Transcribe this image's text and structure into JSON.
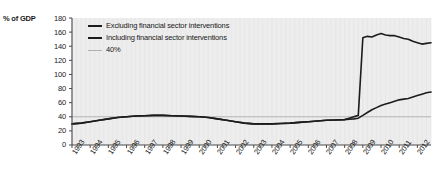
{
  "axis": {
    "y_unit_label": "% of GDP",
    "y_ticks": [
      "180",
      "160",
      "140",
      "120",
      "100",
      "80",
      "60",
      "40",
      "20",
      "0"
    ],
    "x_ticks": [
      "1993",
      "1994",
      "1995",
      "1996",
      "1997",
      "1998",
      "1999",
      "2000",
      "2001",
      "2002",
      "2003",
      "2004",
      "2005",
      "2006",
      "2007",
      "2008",
      "2009",
      "2010",
      "2011",
      "2012"
    ]
  },
  "legend": {
    "items": [
      {
        "label": "Excluding financial sector interventions",
        "style": "thick",
        "color": "#1c1c1c"
      },
      {
        "label": "Including financial sector interventions",
        "style": "thick",
        "color": "#1c1c1c"
      },
      {
        "label": "40%",
        "style": "thin",
        "color": "#b0b0b0"
      }
    ]
  },
  "colors": {
    "plot_background": "#ededed",
    "gridline": "#e2e2e2",
    "axis": "#4a4a4a",
    "series_line": "#1c1c1c",
    "reference_line": "#b5b5b5",
    "text": "#1a1a1a"
  },
  "chart_data": {
    "type": "line",
    "title": "",
    "xlabel": "",
    "ylabel": "% of GDP",
    "ylim": [
      0,
      180
    ],
    "xlim": [
      1993,
      2012.75
    ],
    "grid": true,
    "legend_position": "top-left-inside",
    "annotations": [
      {
        "type": "hline",
        "value": 40,
        "label": "40%"
      }
    ],
    "x": [
      1993,
      1993.5,
      1994,
      1994.5,
      1995,
      1995.5,
      1996,
      1996.5,
      1997,
      1997.5,
      1998,
      1998.5,
      1999,
      1999.5,
      2000,
      2000.5,
      2001,
      2001.5,
      2002,
      2002.5,
      2003,
      2003.5,
      2004,
      2004.5,
      2005,
      2005.5,
      2006,
      2006.5,
      2007,
      2007.5,
      2008,
      2008.25,
      2008.5,
      2008.75,
      2009,
      2009.25,
      2009.5,
      2009.75,
      2010,
      2010.25,
      2010.5,
      2010.75,
      2011,
      2011.25,
      2011.5,
      2011.75,
      2012,
      2012.25,
      2012.5,
      2012.75
    ],
    "series": [
      {
        "name": "Excluding financial sector interventions",
        "values": [
          30,
          31,
          33,
          35,
          37,
          39,
          40,
          41,
          41.5,
          42,
          42,
          41.5,
          41,
          40.5,
          40,
          39,
          37,
          35,
          33,
          31,
          30,
          30,
          30,
          30.5,
          31,
          32,
          33,
          34,
          35,
          35.5,
          36,
          36.5,
          37,
          38,
          42,
          46,
          50,
          53,
          56,
          58,
          60,
          62,
          64,
          65,
          66,
          68,
          70,
          72,
          74,
          75
        ]
      },
      {
        "name": "Including financial sector interventions",
        "values": [
          30,
          31,
          33,
          35,
          37,
          39,
          40,
          41,
          41.5,
          42,
          42,
          41.5,
          41,
          40.5,
          40,
          39,
          37,
          35,
          33,
          31,
          30,
          30,
          30,
          30.5,
          31,
          32,
          33,
          34,
          35,
          35.5,
          36,
          38,
          40,
          42,
          152,
          154,
          153,
          156,
          158,
          156,
          155,
          155,
          153,
          151,
          150,
          147,
          145,
          143,
          144,
          145
        ]
      }
    ]
  }
}
